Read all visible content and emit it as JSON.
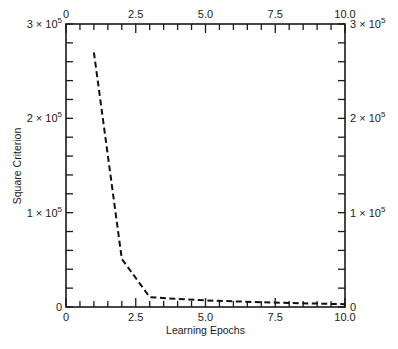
{
  "chart_data": {
    "type": "line",
    "title": "",
    "xlabel": "Learning Epochs",
    "ylabel": "Square Criterion",
    "xlim": [
      0,
      10
    ],
    "ylim": [
      0,
      300000
    ],
    "grid": false,
    "legend": null,
    "x_major_ticks": [
      0,
      2.5,
      5.0,
      7.5,
      10.0
    ],
    "x_tick_labels": [
      "0",
      "2.5",
      "5.0",
      "7.5",
      "10.0"
    ],
    "x_minor_step": 0.5,
    "y_major_ticks": [
      0,
      100000,
      200000,
      300000
    ],
    "y_tick_labels": [
      {
        "base": "0",
        "exp": ""
      },
      {
        "base": "1 × 10",
        "exp": "5"
      },
      {
        "base": "2 × 10",
        "exp": "5"
      },
      {
        "base": "3 × 10",
        "exp": "5"
      }
    ],
    "y_minor_step": 20000,
    "mirror_axes": true,
    "series": [
      {
        "name": "Square Criterion",
        "style": "dashed",
        "color": "#111111",
        "x": [
          1,
          2,
          3,
          4,
          5,
          6,
          7,
          8,
          9,
          10
        ],
        "values": [
          270000,
          51000,
          10500,
          8500,
          7000,
          6000,
          5000,
          4300,
          3600,
          3000
        ]
      }
    ]
  },
  "colors": {
    "axis": "#1a1a1a",
    "line": "#111111",
    "background": "#ffffff"
  }
}
